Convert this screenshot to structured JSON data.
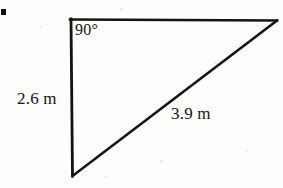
{
  "figure": {
    "kind": "right-triangle-diagram",
    "background_color": "#fdfdfc",
    "stroke_color": "#111111",
    "bullet_marker": "■",
    "labels": {
      "right_angle": "90°",
      "vertical_leg": "2.6 m",
      "hypotenuse": "3.9 m"
    },
    "geometry": {
      "vertices": {
        "top_left": [
          70,
          19
        ],
        "top_right": [
          277,
          20
        ],
        "bottom_left": [
          72,
          175
        ]
      },
      "sides": {
        "top_leg_label": "",
        "vertical_leg_label": "2.6 m",
        "hypotenuse_label": "3.9 m"
      },
      "angle_markers": [
        {
          "at": "top_left",
          "value": "90°"
        }
      ]
    }
  }
}
